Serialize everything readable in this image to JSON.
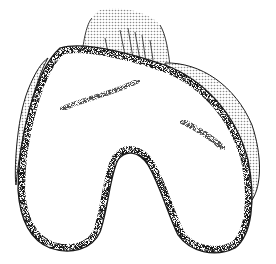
{
  "image": {
    "subject": "distal femur illustration",
    "style": "stippled black-and-white line drawing",
    "colors": {
      "background": "#ffffff",
      "outline": "#1a1a1a",
      "stipple": "#222222",
      "shading": "#b8b8b8"
    }
  }
}
